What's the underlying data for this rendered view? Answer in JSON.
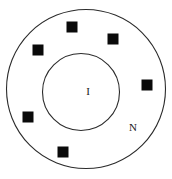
{
  "figure": {
    "type": "annulus-schematic",
    "title": "",
    "background_color": "#ffffff",
    "width": 172,
    "height": 179,
    "stroke_color": "#2b2b2b",
    "marker_color": "#0a0a0a"
  },
  "circles": {
    "outer": {
      "name": "outer-boundary-circle",
      "cx": 86,
      "cy": 89,
      "r": 79.5,
      "stroke_width": 1.1,
      "fill": "none"
    },
    "inner": {
      "name": "inner-boundary-circle",
      "cx": 81,
      "cy": 92,
      "r": 38.5,
      "stroke_width": 1.1,
      "fill": "none"
    }
  },
  "labels": [
    {
      "id": "inner-region-label",
      "text": "I",
      "x": 88,
      "y": 92,
      "font_size": 11
    },
    {
      "id": "outer-region-label",
      "text": "N",
      "x": 133,
      "y": 128,
      "font_size": 11
    }
  ],
  "markers": {
    "shape": "square",
    "size": 11,
    "count": 6,
    "items": [
      {
        "id": "marker-top",
        "cx": 72,
        "cy": 27
      },
      {
        "id": "marker-upper-right",
        "cx": 113,
        "cy": 39
      },
      {
        "id": "marker-upper-left",
        "cx": 38,
        "cy": 50
      },
      {
        "id": "marker-right",
        "cx": 147,
        "cy": 85
      },
      {
        "id": "marker-left",
        "cx": 28,
        "cy": 117
      },
      {
        "id": "marker-bottom",
        "cx": 63,
        "cy": 152
      }
    ]
  }
}
